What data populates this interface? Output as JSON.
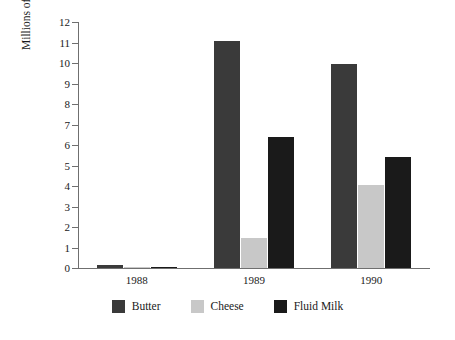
{
  "chart_data": {
    "type": "bar",
    "title": "",
    "xlabel": "",
    "ylabel": "Millions of Pounds",
    "categories": [
      "1988",
      "1989",
      "1990"
    ],
    "ylim": [
      0,
      12
    ],
    "yticks": [
      0,
      1,
      2,
      3,
      4,
      5,
      6,
      7,
      8,
      9,
      10,
      11,
      12
    ],
    "ytick_labels": [
      "0",
      "1",
      "2",
      "3",
      "4",
      "5",
      "6",
      "7",
      "8",
      "9",
      "10",
      "11",
      "12"
    ],
    "grid": false,
    "legend_position": "bottom",
    "series": [
      {
        "name": "Butter",
        "color": "#3a3a3a",
        "values": [
          0.17,
          11.05,
          9.95
        ]
      },
      {
        "name": "Cheese",
        "color": "#c8c8c8",
        "values": [
          0.04,
          1.45,
          4.05
        ]
      },
      {
        "name": "Fluid Milk",
        "color": "#1a1a1a",
        "values": [
          0.04,
          6.4,
          5.4
        ]
      }
    ]
  },
  "axis": {
    "y_title": "Millions of Pounds"
  },
  "legend": {
    "entries": [
      {
        "label": "Butter"
      },
      {
        "label": "Cheese"
      },
      {
        "label": "Fluid Milk"
      }
    ]
  }
}
